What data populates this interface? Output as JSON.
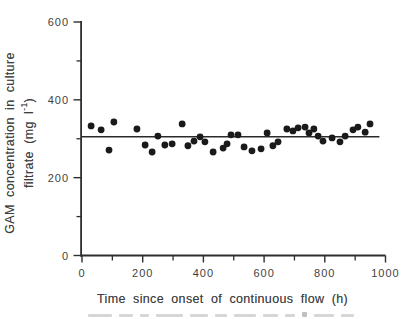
{
  "figure": {
    "background": "#ffffff",
    "ink_color": "#3f3f3f",
    "axis_color": "#2e2e2e",
    "point_color": "#1a1a1a",
    "mean_line_color": "#2a2a2a"
  },
  "x_axis": {
    "title": "Time since onset of continuous flow (h)",
    "range": [
      0,
      1000
    ],
    "major_ticks": [
      0,
      200,
      400,
      600,
      800,
      1000
    ],
    "tick_labels": [
      "0",
      "200",
      "400",
      "600",
      "800",
      "1000"
    ],
    "minor_ticks": [
      100,
      300,
      500,
      700,
      900
    ]
  },
  "y_axis": {
    "title_line1": "GAM concentration in culture",
    "title_line2_prefix": "filtrate (mg l",
    "title_line2_superscript": "-1",
    "title_line2_suffix": ")",
    "range": [
      0,
      600
    ],
    "major_ticks": [
      0,
      200,
      400,
      600
    ],
    "tick_labels": [
      "0",
      "200",
      "400",
      "600"
    ],
    "minor_ticks": [
      100,
      300,
      500
    ]
  },
  "chart_data": {
    "type": "scatter",
    "title": "",
    "xlabel": "Time since onset of continuous flow (h)",
    "ylabel": "GAM concentration in culture filtrate (mg l-1)",
    "xlim": [
      0,
      1000
    ],
    "ylim": [
      0,
      600
    ],
    "grid": false,
    "legend": false,
    "marker": "filled-circle",
    "points": [
      [
        30,
        333
      ],
      [
        63,
        323
      ],
      [
        89,
        271
      ],
      [
        105,
        343
      ],
      [
        181,
        325
      ],
      [
        208,
        284
      ],
      [
        231,
        266
      ],
      [
        250,
        307
      ],
      [
        273,
        284
      ],
      [
        297,
        287
      ],
      [
        330,
        338
      ],
      [
        349,
        282
      ],
      [
        369,
        294
      ],
      [
        389,
        305
      ],
      [
        405,
        292
      ],
      [
        432,
        266
      ],
      [
        465,
        276
      ],
      [
        478,
        287
      ],
      [
        491,
        310
      ],
      [
        514,
        310
      ],
      [
        534,
        279
      ],
      [
        560,
        269
      ],
      [
        590,
        274
      ],
      [
        610,
        315
      ],
      [
        629,
        282
      ],
      [
        646,
        292
      ],
      [
        675,
        325
      ],
      [
        695,
        320
      ],
      [
        712,
        328
      ],
      [
        735,
        330
      ],
      [
        748,
        315
      ],
      [
        764,
        325
      ],
      [
        778,
        307
      ],
      [
        794,
        294
      ],
      [
        824,
        302
      ],
      [
        850,
        292
      ],
      [
        867,
        307
      ],
      [
        893,
        323
      ],
      [
        909,
        330
      ],
      [
        933,
        317
      ],
      [
        949,
        338
      ]
    ],
    "mean_line": {
      "type": "horizontal",
      "value": 305,
      "x_start": 0,
      "x_end": 980
    }
  }
}
